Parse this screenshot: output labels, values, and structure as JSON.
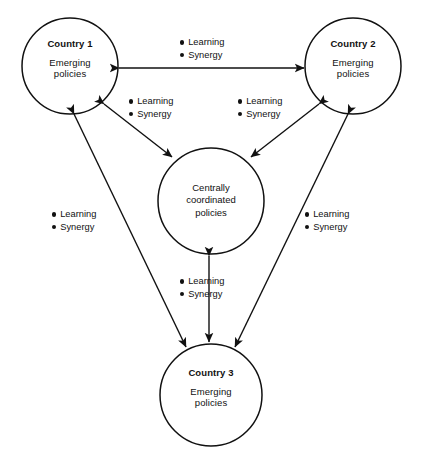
{
  "diagram": {
    "type": "network-diagram",
    "stroke_color": "#111111",
    "background_color": "#ffffff",
    "nodes": [
      {
        "id": "country-1",
        "title": "Country 1",
        "subtitle_line1": "Emerging",
        "subtitle_line2": "policies",
        "cx": 70,
        "cy": 66,
        "r": 48
      },
      {
        "id": "country-2",
        "title": "Country 2",
        "subtitle_line1": "Emerging",
        "subtitle_line2": "policies",
        "cx": 353,
        "cy": 66,
        "r": 48
      },
      {
        "id": "central",
        "title": "",
        "line1": "Centrally",
        "line2": "coordinated",
        "line3": "policies",
        "cx": 211,
        "cy": 201,
        "r": 53
      },
      {
        "id": "country-3",
        "title": "Country 3",
        "subtitle_line1": "Emerging",
        "subtitle_line2": "policies",
        "cx": 211,
        "cy": 395,
        "r": 51
      }
    ],
    "edge_labels": [
      {
        "id": "label-top",
        "bullet1": "Learning",
        "bullet2": "Synergy",
        "x": 180,
        "y": 36
      },
      {
        "id": "label-left-center",
        "bullet1": "Learning",
        "bullet2": "Synergy",
        "x": 129,
        "y": 95
      },
      {
        "id": "label-right-center",
        "bullet1": "Learning",
        "bullet2": "Synergy",
        "x": 238,
        "y": 95
      },
      {
        "id": "label-left-lower",
        "bullet1": "Learning",
        "bullet2": "Synergy",
        "x": 52,
        "y": 208
      },
      {
        "id": "label-right-lower",
        "bullet1": "Learning",
        "bullet2": "Synergy",
        "x": 305,
        "y": 208
      },
      {
        "id": "label-bottom",
        "bullet1": "Learning",
        "bullet2": "Synergy",
        "x": 180,
        "y": 275
      }
    ],
    "edges": [
      {
        "id": "edge-c1-c2",
        "from": "country-1",
        "to": "country-2",
        "arrows": "both"
      },
      {
        "id": "edge-c1-central",
        "from": "country-1",
        "to": "central",
        "arrows": "both"
      },
      {
        "id": "edge-c2-central",
        "from": "country-2",
        "to": "central",
        "arrows": "both"
      },
      {
        "id": "edge-c3-central",
        "from": "country-3",
        "to": "central",
        "arrows": "both"
      },
      {
        "id": "edge-c1-c3",
        "from": "country-1",
        "to": "country-3",
        "arrows": "both"
      },
      {
        "id": "edge-c2-c3",
        "from": "country-2",
        "to": "country-3",
        "arrows": "both"
      }
    ]
  }
}
